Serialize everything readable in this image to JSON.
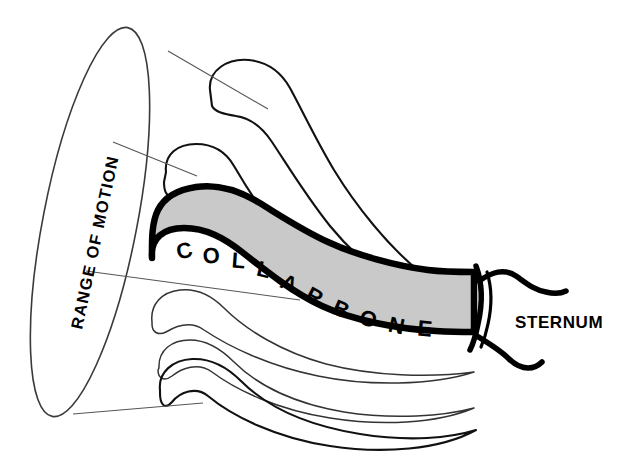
{
  "figure": {
    "background_color": "#ffffff",
    "bone_fill_color": "#c9c9c9",
    "outline_color": "#000000",
    "leader_line_color": "#555555"
  },
  "labels": {
    "range_of_motion": "RANGE OF MOTION",
    "sternum": "STERNUM",
    "collarbone": "COLLARBONE",
    "collarbone_letters": [
      {
        "char": "C",
        "x": 186,
        "y": 258,
        "rotate": -13
      },
      {
        "char": "O",
        "x": 212,
        "y": 263,
        "rotate": -6
      },
      {
        "char": "L",
        "x": 238,
        "y": 268,
        "rotate": 4
      },
      {
        "char": "L",
        "x": 262,
        "y": 276,
        "rotate": 14
      },
      {
        "char": "A",
        "x": 286,
        "y": 289,
        "rotate": 24
      },
      {
        "char": "R",
        "x": 310,
        "y": 302,
        "rotate": 28
      },
      {
        "char": "B",
        "x": 337,
        "y": 315,
        "rotate": 24
      },
      {
        "char": "O",
        "x": 365,
        "y": 325,
        "rotate": 18
      },
      {
        "char": "N",
        "x": 394,
        "y": 332,
        "rotate": 12
      },
      {
        "char": "E",
        "x": 423,
        "y": 335,
        "rotate": 6
      }
    ]
  },
  "annotations": {
    "leader_lines": [
      {
        "name": "leader-to-top-position",
        "x1": 168,
        "y1": 51,
        "x2": 268,
        "y2": 109
      },
      {
        "name": "leader-to-upper-position",
        "x1": 113,
        "y1": 142,
        "x2": 197,
        "y2": 176
      },
      {
        "name": "leader-to-collarbone",
        "x1": 86,
        "y1": 271,
        "x2": 300,
        "y2": 300
      },
      {
        "name": "leader-to-bottom-position",
        "x1": 73,
        "y1": 414,
        "x2": 203,
        "y2": 403
      }
    ]
  },
  "shapes": {
    "motion_ellipse": {
      "name": "range-of-motion-ellipse",
      "cx": 90,
      "cy": 222,
      "rx": 47,
      "ry": 198,
      "rotation_deg": 11
    },
    "ghost_positions": [
      {
        "name": "clavicle-position-1-raised",
        "emphasis": "bold"
      },
      {
        "name": "clavicle-position-2-raised",
        "emphasis": "bold"
      },
      {
        "name": "clavicle-position-3-mid",
        "emphasis": "thin"
      },
      {
        "name": "clavicle-position-4-lowered",
        "emphasis": "thin"
      },
      {
        "name": "clavicle-position-5-lowered",
        "emphasis": "bold"
      }
    ],
    "sternum_joint": {
      "name": "sternoclavicular-joint",
      "x": 478,
      "y": 300
    }
  }
}
